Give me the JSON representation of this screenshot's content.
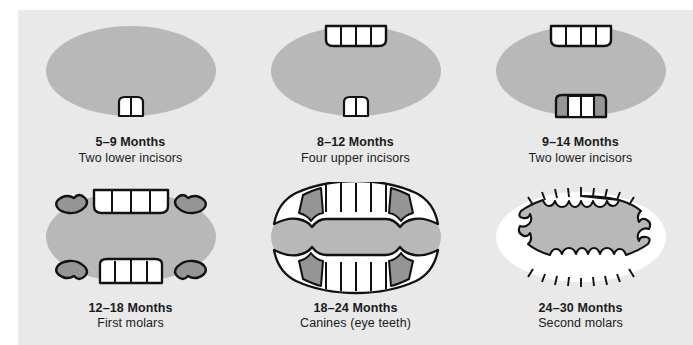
{
  "figure": {
    "colors": {
      "page_background": "#ffffff",
      "panel_background": "#e9e9e9",
      "mouth_fill": "#b8b8b8",
      "gum_shadow": "#959595",
      "tooth_fill": "#ffffff",
      "outline": "#111111",
      "text": "#1a1a1a"
    }
  },
  "panels": [
    {
      "id": "panel-5-9-months",
      "age": "5–9 Months",
      "description": "Two lower incisors",
      "upper_teeth": 0,
      "lower_teeth": 2,
      "molars": 0,
      "stage": 1
    },
    {
      "id": "panel-8-12-months",
      "age": "8–12 Months",
      "description": "Four upper incisors",
      "upper_teeth": 4,
      "lower_teeth": 2,
      "molars": 0,
      "stage": 2
    },
    {
      "id": "panel-9-14-months",
      "age": "9–14 Months",
      "description": "Two lower incisors",
      "upper_teeth": 4,
      "lower_teeth": 4,
      "molars": 0,
      "stage": 3
    },
    {
      "id": "panel-12-18-months",
      "age": "12–18 Months",
      "description": "First molars",
      "upper_teeth": 4,
      "lower_teeth": 4,
      "molars": 4,
      "stage": 4
    },
    {
      "id": "panel-18-24-months",
      "age": "18–24 Months",
      "description": "Canines (eye teeth)",
      "upper_teeth": 6,
      "lower_teeth": 6,
      "molars": 4,
      "stage": 5
    },
    {
      "id": "panel-24-30-months",
      "age": "24–30 Months",
      "description": "Second molars",
      "upper_teeth": 10,
      "lower_teeth": 10,
      "molars": 8,
      "stage": 6
    }
  ]
}
